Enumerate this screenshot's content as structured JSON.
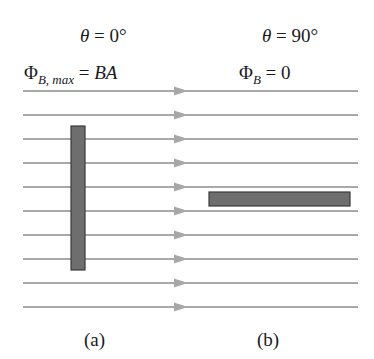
{
  "panel_a": {
    "angle_symbol": "θ",
    "angle_rest": " = 0°",
    "flux_symbol": "Φ",
    "flux_sub": "B, max",
    "flux_eq": " = ",
    "flux_value": "BA",
    "caption": "(a)"
  },
  "panel_b": {
    "angle_symbol": "θ",
    "angle_rest": " = 90°",
    "flux_symbol": "Φ",
    "flux_sub": "B",
    "flux_eq": " = 0",
    "caption": "(b)"
  },
  "field_lines": {
    "count": 10,
    "y_positions": [
      91,
      115,
      139,
      163,
      187,
      211,
      235,
      259,
      283,
      307
    ],
    "x_start": 23,
    "x_end": 358,
    "arrow_x": 183,
    "color": "#a8a8a8"
  },
  "loop_a": {
    "orientation": "perpendicular-to-field",
    "x": 71,
    "y": 126,
    "w": 14,
    "h": 144,
    "fill": "#6e6e6e",
    "stroke": "#3a3a3a"
  },
  "loop_b": {
    "orientation": "parallel-to-field",
    "x": 209,
    "y": 192,
    "w": 141,
    "h": 14,
    "fill": "#6e6e6e",
    "stroke": "#3a3a3a"
  }
}
